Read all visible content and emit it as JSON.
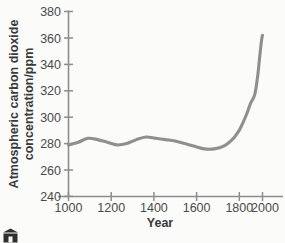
{
  "figure": {
    "background_color": "#fbfbfa",
    "curve_color": "#8f8f8f",
    "axis_color": "#8d8d8d",
    "text_color": "#3d3d3d"
  },
  "caption": {
    "icon_name": "building-icon",
    "text": ""
  },
  "chart_data": {
    "type": "line",
    "title": "",
    "xlabel": "Year",
    "ylabel": "Atmospheric carbon dioxide concentration/ppm",
    "ylabel_line1": "Atmospheric carbon dioxide",
    "ylabel_line2": "concentration/ppm",
    "xlim": [
      1000,
      2000
    ],
    "ylim": [
      240,
      380
    ],
    "xticks": [
      1000,
      1200,
      1400,
      1600,
      1800,
      2000
    ],
    "xtick_labels": [
      "1000",
      "1200",
      "1400",
      "1600",
      "1800",
      "2000"
    ],
    "yticks": [
      240,
      260,
      280,
      300,
      320,
      340,
      360,
      380
    ],
    "ytick_labels": [
      "240",
      "260",
      "280",
      "300",
      "320",
      "340",
      "360",
      "380"
    ],
    "grid": false,
    "legend": false,
    "series": [
      {
        "name": "Atmospheric CO2 concentration",
        "x": [
          1000,
          1050,
          1100,
          1150,
          1200,
          1250,
          1300,
          1350,
          1400,
          1450,
          1500,
          1550,
          1600,
          1650,
          1700,
          1750,
          1800,
          1850,
          1880,
          1900,
          1920,
          1940,
          1960,
          1975,
          1985,
          1995,
          2000
        ],
        "values": [
          279,
          281,
          284,
          283,
          281,
          279,
          280,
          283,
          285,
          284,
          283,
          282,
          280,
          278,
          276,
          276,
          278,
          284,
          290,
          296,
          303,
          311,
          317,
          331,
          345,
          358,
          362
        ]
      }
    ]
  }
}
